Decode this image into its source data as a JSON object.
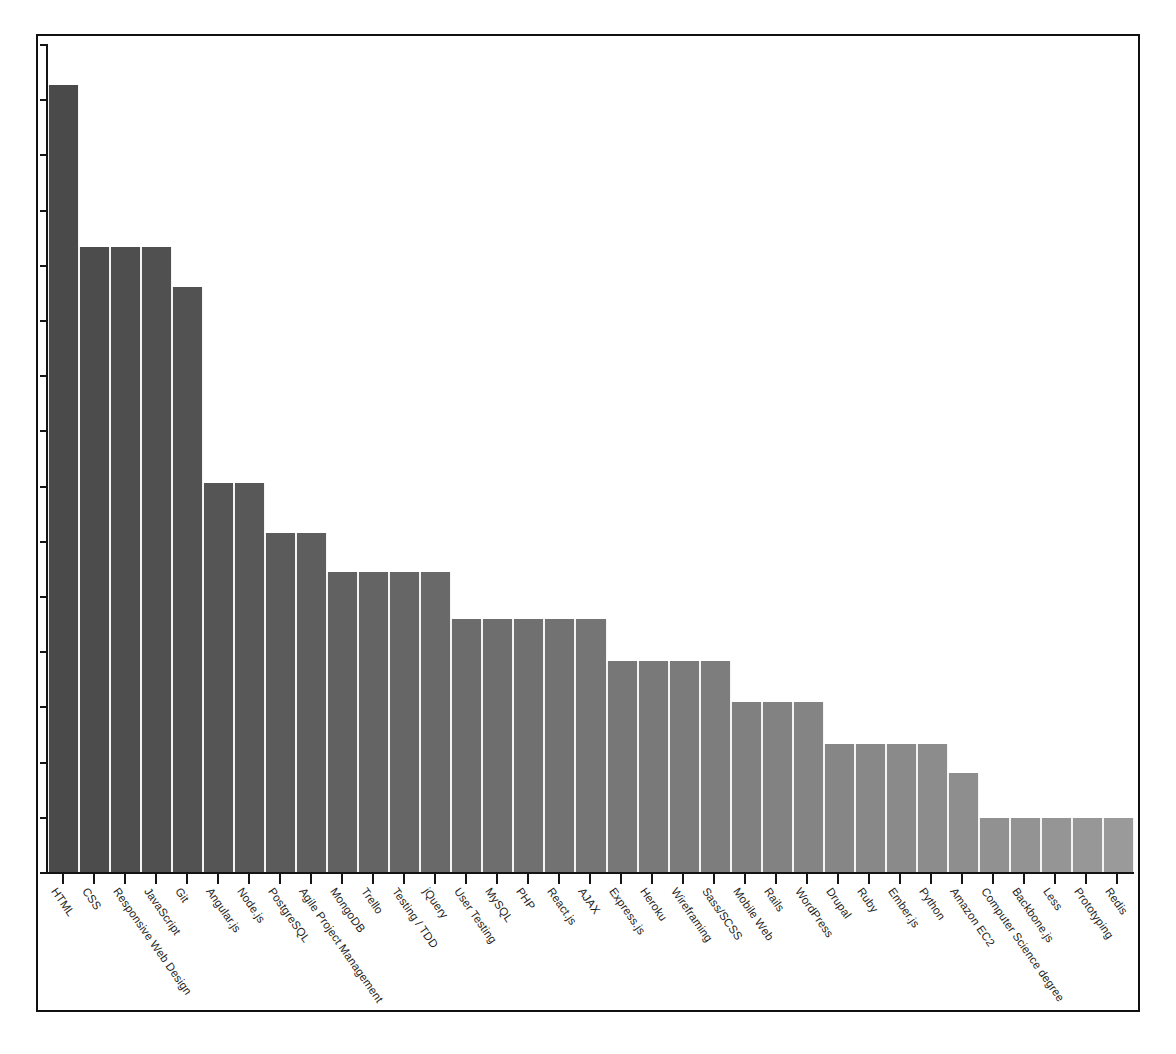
{
  "chart_data": {
    "type": "bar",
    "title": "",
    "subtitle": "",
    "xlabel": "",
    "ylabel": "",
    "grid": false,
    "legend": false,
    "axis_tick_labels": {
      "y": [],
      "note": "y-axis has evenly spaced unlabeled tick marks only"
    },
    "y_tick_count": 15,
    "ylim": [
      0,
      100
    ],
    "categories": [
      "HTML",
      "CSS",
      "Responsive Web Design",
      "JavaScript",
      "Git",
      "Angular.js",
      "Node.js",
      "PostgreSQL",
      "Agile Project Management",
      "MongoDB",
      "Trello",
      "Testing / TDD",
      "jQuery",
      "User Testing",
      "MySQL",
      "PHP",
      "React.js",
      "AJAX",
      "Express.js",
      "Heroku",
      "Wireframing",
      "Sass/SCSS",
      "Mobile Web",
      "Rails",
      "WordPress",
      "Drupal",
      "Ruby",
      "Ember.js",
      "Python",
      "Amazon EC2",
      "Computer Science degree",
      "Backbone.js",
      "Less",
      "Prototyping",
      "Redis"
    ],
    "values": [
      95.0,
      75.5,
      75.5,
      75.5,
      70.7,
      47.0,
      47.0,
      41.0,
      41.0,
      36.2,
      36.2,
      36.2,
      36.2,
      30.5,
      30.5,
      30.5,
      30.5,
      30.5,
      25.5,
      25.5,
      25.5,
      25.5,
      20.5,
      20.5,
      20.5,
      15.5,
      15.5,
      15.5,
      15.5,
      12.0,
      6.5,
      6.5,
      6.5,
      6.5,
      6.5
    ],
    "bar_colors": [
      "#4a4a4a",
      "#4c4c4c",
      "#4e4e4e",
      "#505050",
      "#525252",
      "#555555",
      "#585858",
      "#5b5b5b",
      "#5e5e5e",
      "#616161",
      "#646464",
      "#666666",
      "#696969",
      "#6c6c6c",
      "#6e6e6e",
      "#707070",
      "#727272",
      "#757575",
      "#777777",
      "#797979",
      "#7b7b7b",
      "#7d7d7d",
      "#808080",
      "#828282",
      "#848484",
      "#868686",
      "#888888",
      "#8a8a8a",
      "#8c8c8c",
      "#8e8e8e",
      "#919191",
      "#939393",
      "#959595",
      "#979797",
      "#9a9a9a"
    ]
  },
  "colors": {
    "axis": "#141414",
    "frame": "#101010",
    "background": "#ffffff",
    "bar_dark": "#4a4a4a",
    "bar_light": "#9a9a9a",
    "label_text": "#1d1d1d"
  }
}
